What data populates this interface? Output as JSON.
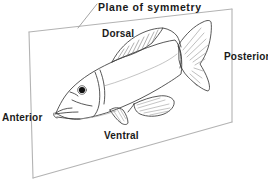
{
  "figure": {
    "kind": "anatomical-direction-diagram",
    "background_color": "#ffffff",
    "plane_color": "#b3b3b3",
    "outline_color": "#3a3a3a",
    "label_color": "#1a1a1a",
    "eye_color": "#111111"
  },
  "labels": {
    "title": "Plane of symmetry",
    "dorsal": "Dorsal",
    "anterior": "Anterior",
    "posterior": "Posterior",
    "ventral": "Ventral"
  }
}
